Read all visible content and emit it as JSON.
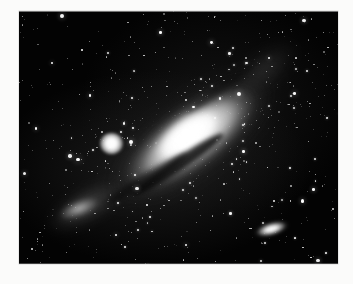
{
  "page": {
    "background_color": "#fbfbfa",
    "width": 353,
    "height": 284
  },
  "plate": {
    "label": "Andromeda Galaxy photographic plate",
    "frame_color": "#000000",
    "sky_color": "#030303",
    "star_color": "#ffffff",
    "x": 19,
    "y": 11,
    "width": 319,
    "height": 253,
    "caption": ""
  },
  "objects": [
    {
      "name": "main-galaxy",
      "label": "Andromeda Galaxy",
      "type": "spiral-galaxy",
      "center_pct": [
        52,
        48
      ],
      "angle_deg": -36,
      "brightness": "very-bright"
    },
    {
      "name": "companion-m32",
      "label": "M32 companion",
      "type": "elliptical-galaxy",
      "center_pct": [
        29,
        52
      ],
      "angle_deg": 0,
      "brightness": "bright"
    },
    {
      "name": "companion-ngc205",
      "label": "NGC 205 companion",
      "type": "elliptical-galaxy",
      "center_pct": [
        79,
        86
      ],
      "angle_deg": -16,
      "brightness": "moderate"
    },
    {
      "name": "arm-sw",
      "label": "southwest star cloud",
      "type": "spiral-arm",
      "center_pct": [
        21,
        77
      ],
      "angle_deg": -30,
      "brightness": "faint"
    },
    {
      "name": "arm-ne",
      "label": "northeast star cloud",
      "type": "spiral-arm",
      "center_pct": [
        77,
        23
      ],
      "angle_deg": -38,
      "brightness": "faint"
    }
  ],
  "starfield": {
    "count": 1400,
    "seed": 20240311,
    "bright_count": 90
  }
}
